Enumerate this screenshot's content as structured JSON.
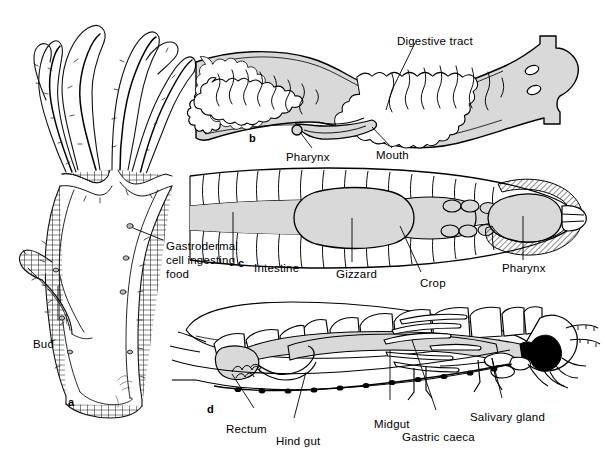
{
  "figure": {
    "background_color": "#ffffff",
    "line_color": "#000000",
    "gut_fill_color": "#d9d9d9",
    "dark_fill_color": "#000000",
    "width": 605,
    "height": 469
  },
  "panels": [
    {
      "id": "a",
      "id_label": "a",
      "organism": "hydra",
      "description": "Longitudinal section of a hydra showing gastrovascular cavity, tentacles and a developing bud",
      "labels": [
        {
          "name": "bud",
          "text": "Bud"
        },
        {
          "name": "gastrodermal-cell",
          "text": "Gastrodermal cell ingesting food"
        }
      ]
    },
    {
      "id": "b",
      "id_label": "b",
      "organism": "planarian",
      "description": "Planarian flatworm with branched gastrovascular cavity, pharynx and ventral mouth",
      "labels": [
        {
          "name": "digestive-tract",
          "text": "Digestive tract"
        },
        {
          "name": "pharynx",
          "text": "Pharynx"
        },
        {
          "name": "mouth",
          "text": "Mouth"
        }
      ]
    },
    {
      "id": "c",
      "id_label": "c",
      "organism": "earthworm",
      "description": "Segmented earthworm with complete digestive tube: pharynx, crop, gizzard and intestine",
      "labels": [
        {
          "name": "intestine",
          "text": "Intestine"
        },
        {
          "name": "gizzard",
          "text": "Gizzard"
        },
        {
          "name": "crop",
          "text": "Crop"
        },
        {
          "name": "pharynx",
          "text": "Pharynx"
        }
      ]
    },
    {
      "id": "d",
      "id_label": "d",
      "organism": "insect",
      "description": "Lateral view of an insect showing salivary gland, gastric caeca, midgut, hind gut and rectum",
      "labels": [
        {
          "name": "rectum",
          "text": "Rectum"
        },
        {
          "name": "hind-gut",
          "text": "Hind gut"
        },
        {
          "name": "midgut",
          "text": "Midgut"
        },
        {
          "name": "gastric-caeca",
          "text": "Gastric caeca"
        },
        {
          "name": "salivary-gland",
          "text": "Salivary gland"
        }
      ]
    }
  ],
  "label_text": {
    "bud": "Bud",
    "gastrodermal_line1": "Gastrodermal",
    "gastrodermal_line2": "cell ingesting",
    "gastrodermal_line3": "food",
    "digestive_tract": "Digestive tract",
    "pharynx_b": "Pharynx",
    "mouth": "Mouth",
    "intestine": "Intestine",
    "gizzard": "Gizzard",
    "crop": "Crop",
    "pharynx_c": "Pharynx",
    "rectum": "Rectum",
    "hind_gut": "Hind gut",
    "midgut": "Midgut",
    "gastric_caeca": "Gastric caeca",
    "salivary_gland": "Salivary gland",
    "panel_a": "a",
    "panel_b": "b",
    "panel_c": "c",
    "panel_d": "d"
  }
}
